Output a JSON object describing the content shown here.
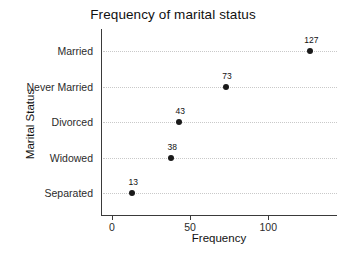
{
  "chart_data": {
    "type": "scatter",
    "title": "Frequency of marital status",
    "xlabel": "Frequency",
    "ylabel": "Marital Status",
    "categories": [
      "Married",
      "Never Married",
      "Divorced",
      "Widowed",
      "Separated"
    ],
    "values": [
      127,
      73,
      43,
      38,
      13
    ],
    "point_labels": [
      "127",
      "73",
      "43",
      "38",
      "13"
    ],
    "xticks": [
      0,
      50,
      100
    ],
    "xtick_labels": [
      "0",
      "50",
      "100"
    ],
    "xlim": [
      -7,
      144
    ],
    "grid": "horizontal-dotted",
    "legend": "none",
    "orientation": "horizontal-dotplot",
    "colors": {
      "point": "#1a1a1a",
      "axis": "#3a3a3a",
      "grid": "#c9c9c9",
      "text": "#111111",
      "background": "#ffffff"
    }
  }
}
